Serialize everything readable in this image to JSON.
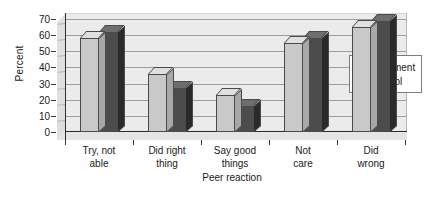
{
  "chart_data": {
    "type": "bar",
    "title": "",
    "xlabel": "Peer reaction",
    "ylabel": "Percent",
    "categories": [
      "Try, not able",
      "Did right thing",
      "Say good things",
      "Not care",
      "Did wrong"
    ],
    "category_lines": [
      [
        "Try, not",
        "able"
      ],
      [
        "Did right",
        "thing"
      ],
      [
        "Say good",
        "things"
      ],
      [
        "Not",
        "care"
      ],
      [
        "Did",
        "wrong"
      ]
    ],
    "series": [
      {
        "name": "Treatment",
        "color": "#c9c9c9",
        "values": [
          58,
          36,
          23,
          55,
          65
        ]
      },
      {
        "name": "Control",
        "color": "#4c4c4c",
        "values": [
          62,
          27,
          16,
          58,
          69
        ]
      }
    ],
    "ylim": [
      0,
      70
    ],
    "yticks": [
      0,
      10,
      20,
      30,
      40,
      50,
      60,
      70
    ],
    "ytick_labels": [
      "0",
      "10",
      "20",
      "30",
      "40",
      "50",
      "60",
      "70"
    ],
    "grid": true,
    "legend_position": "right"
  },
  "legend": {
    "entries": [
      {
        "label": "Treatment"
      },
      {
        "label": "Control"
      }
    ]
  }
}
